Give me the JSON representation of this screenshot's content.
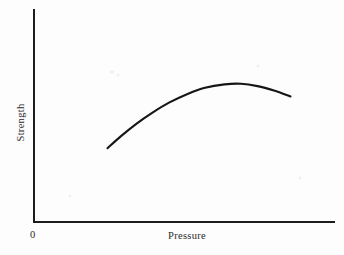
{
  "figure": {
    "background_color": "#fdfdfd",
    "axis_color": "#1c1c1c",
    "curve_color": "#161616",
    "origin_label": "0"
  },
  "chart_data": {
    "type": "line",
    "title": "",
    "subtitle": "",
    "xlabel": "Pressure",
    "ylabel": "Strength",
    "legend": [],
    "legend_position": "none",
    "grid": false,
    "axis_ticks": false,
    "tick_labels": {
      "x": [],
      "y": [],
      "origin": "0"
    },
    "xlim": [
      0,
      10
    ],
    "ylim": [
      0,
      10
    ],
    "annotations": [],
    "series": [
      {
        "name": "Strength vs Pressure",
        "x": [
          2.45,
          2.9,
          3.4,
          3.95,
          4.5,
          5.1,
          5.7,
          6.35,
          6.9,
          7.45,
          8.0,
          8.55
        ],
        "y": [
          3.48,
          4.05,
          4.62,
          5.16,
          5.63,
          6.03,
          6.33,
          6.49,
          6.52,
          6.41,
          6.2,
          5.92
        ]
      }
    ]
  }
}
